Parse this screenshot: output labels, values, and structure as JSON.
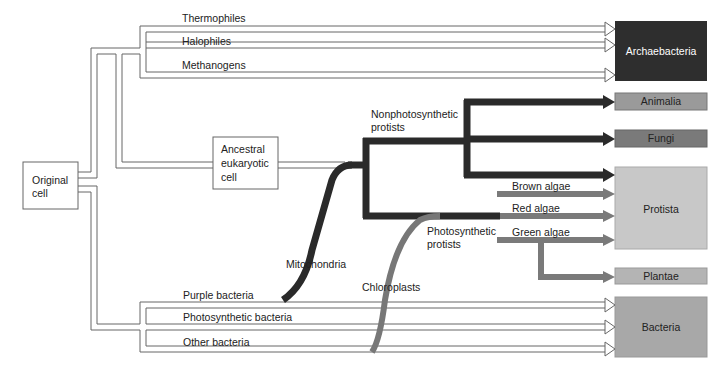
{
  "diagram": {
    "root": {
      "label_line1": "Original",
      "label_line2": "cell"
    },
    "ancestral": {
      "line1": "Ancestral",
      "line2": "eukaryotic",
      "line3": "cell"
    },
    "archaea_branches": [
      "Thermophiles",
      "Halophiles",
      "Methanogens"
    ],
    "bacteria_branches": [
      "Purple bacteria",
      "Photosynthetic bacteria",
      "Other bacteria"
    ],
    "endosymbionts": {
      "mitochondria": "Mitochondria",
      "chloroplasts": "Chloroplasts"
    },
    "protist_groups": {
      "nonphoto_line1": "Nonphotosynthetic",
      "nonphoto_line2": "protists",
      "photo_line1": "Photosynthetic",
      "photo_line2": "protists"
    },
    "algae": [
      "Brown algae",
      "Red algae",
      "Green algae"
    ],
    "kingdoms": {
      "archaebacteria": {
        "label": "Archaebacteria",
        "color": "#2e2e2e"
      },
      "animalia": {
        "label": "Animalia",
        "color": "#9a9a9a"
      },
      "fungi": {
        "label": "Fungi",
        "color": "#7a7a7a"
      },
      "protista": {
        "label": "Protista",
        "color": "#c8c8c8"
      },
      "plantae": {
        "label": "Plantae",
        "color": "#b4b4b4"
      },
      "bacteria": {
        "label": "Bacteria",
        "color": "#a8a8a8"
      }
    }
  }
}
